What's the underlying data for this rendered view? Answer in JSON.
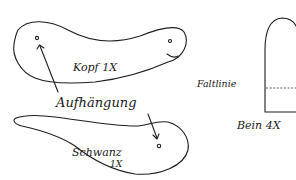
{
  "pieces": {
    "head": {
      "label": "Kopf 1X"
    },
    "tail": {
      "label_line1": "Schwanz",
      "label_line2": "1X"
    },
    "leg": {
      "label": "Bein 4X",
      "fold_label": "Faltlinie"
    }
  },
  "annotation": {
    "label": "Aufhängung"
  },
  "colors": {
    "ink": "#1e1e1e",
    "paper": "#ffffff"
  }
}
